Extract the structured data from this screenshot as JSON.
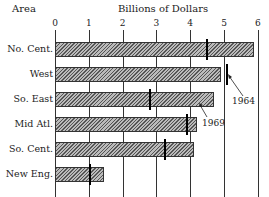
{
  "chart_data": {
    "type": "bar",
    "orientation": "horizontal",
    "title": "Billions of Dollars",
    "ylabel": "Area",
    "xlabel": "Billions of Dollars",
    "xlim": [
      0,
      6
    ],
    "xticks": [
      0,
      1,
      2,
      3,
      4,
      5,
      6
    ],
    "grid": true,
    "categories": [
      "No. Cent.",
      "West",
      "So. East",
      "Mid Atl.",
      "So. Cent.",
      "New Eng."
    ],
    "series": [
      {
        "name": "1969",
        "style": "hatched bar",
        "values": [
          5.9,
          4.9,
          4.7,
          4.2,
          4.1,
          1.45
        ]
      },
      {
        "name": "1964",
        "style": "vertical marker",
        "values": [
          4.5,
          5.1,
          2.8,
          3.9,
          3.25,
          1.05
        ]
      }
    ],
    "annotations": [
      {
        "text": "1964",
        "points_to": "West 1964 marker"
      },
      {
        "text": "1969",
        "points_to": "So. East bar end"
      }
    ]
  },
  "header": {
    "area_label": "Area",
    "axis_title": "Billions of Dollars"
  },
  "ticks": [
    "0",
    "1",
    "2",
    "3",
    "4",
    "5",
    "6"
  ],
  "rows": [
    {
      "label": "No. Cent."
    },
    {
      "label": "West"
    },
    {
      "label": "So. East"
    },
    {
      "label": "Mid Atl."
    },
    {
      "label": "So. Cent."
    },
    {
      "label": "New Eng."
    }
  ],
  "annotations": {
    "label_1964": "1964",
    "label_1969": "1969"
  }
}
